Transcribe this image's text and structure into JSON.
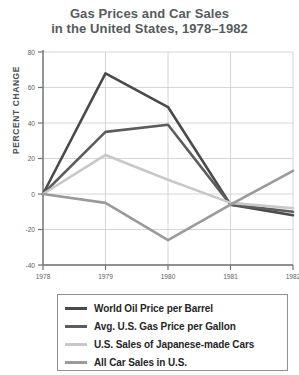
{
  "chart_data": {
    "type": "line",
    "title": "Gas Prices and Car Sales in the United States, 1978–1982",
    "title_lines": [
      "Gas Prices and Car Sales",
      "in the United States, 1978–1982"
    ],
    "xlabel": "",
    "ylabel": "PERCENT CHANGE",
    "x": [
      1978,
      1979,
      1980,
      1981,
      1982
    ],
    "xtick_labels": [
      "1978",
      "1979",
      "1980",
      "1981",
      "1982"
    ],
    "xlim": [
      1978,
      1982
    ],
    "ylim": [
      -40,
      80
    ],
    "ytick_labels": [
      "80",
      "60",
      "40",
      "20",
      "0",
      "-20",
      "-40"
    ],
    "ytick_values": [
      80,
      60,
      40,
      20,
      0,
      -20,
      -40
    ],
    "grid": true,
    "legend_position": "below",
    "series": [
      {
        "name": "World Oil Price per Barrel",
        "color": "#4a4a4a",
        "values": [
          0,
          68,
          49,
          -6,
          -12
        ]
      },
      {
        "name": "Avg. U.S. Gas Price per Gallon",
        "color": "#5d5d5d",
        "values": [
          0,
          35,
          39,
          -6,
          -10
        ]
      },
      {
        "name": "U.S. Sales of Japanese-made Cars",
        "color": "#c8c8c8",
        "values": [
          0,
          22,
          8,
          -5,
          -8
        ]
      },
      {
        "name": "All Car Sales in U.S.",
        "color": "#9a9a9a",
        "values": [
          0,
          -5,
          -26,
          -6,
          13
        ]
      }
    ]
  },
  "axis": {
    "ylabel": "PERCENT CHANGE",
    "ytick_labels": [
      "80",
      "60",
      "40",
      "20",
      "0",
      "-20",
      "-40"
    ],
    "xtick_labels": [
      "1978",
      "1979",
      "1980",
      "1981",
      "1982"
    ]
  },
  "legend": {
    "items": [
      {
        "label": "World Oil Price per Barrel",
        "color": "#4a4a4a"
      },
      {
        "label": "Avg. U.S. Gas Price per Gallon",
        "color": "#5d5d5d"
      },
      {
        "label": "U.S. Sales of Japanese-made Cars",
        "color": "#c8c8c8"
      },
      {
        "label": "All Car Sales in U.S.",
        "color": "#9a9a9a"
      }
    ]
  },
  "colors": {
    "title": "#555b5e",
    "axis": "#6f7476",
    "grid": "#c9cccd",
    "tick_text": "#5a5f61"
  }
}
